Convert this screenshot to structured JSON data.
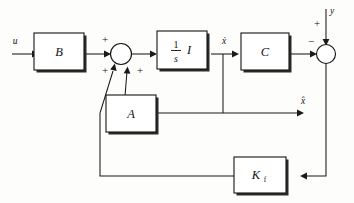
{
  "diagram": {
    "type": "control-block-diagram",
    "background_color": "#fdfdfb",
    "line_color": "#1a1a1a",
    "signals": {
      "input": "u",
      "output": "y",
      "state_derivative": "ẋ",
      "state_estimate": "x̂"
    },
    "blocks": [
      {
        "id": "B",
        "label": "B"
      },
      {
        "id": "integrator",
        "label_numerator": "1",
        "label_denominator": "s",
        "label_matrix": "I"
      },
      {
        "id": "C",
        "label": "C"
      },
      {
        "id": "A",
        "label": "A"
      },
      {
        "id": "Kf",
        "label": "K",
        "subscript": "f"
      }
    ],
    "summing_junctions": [
      {
        "id": "left-sum",
        "signs": {
          "top_left": "+",
          "bottom_left": "+",
          "bottom_right": "+"
        }
      },
      {
        "id": "right-sum",
        "signs": {
          "left": "−",
          "top": "+"
        }
      }
    ],
    "labels": {
      "u": "u",
      "y": "y",
      "xdot_after_integrator": "ẋ",
      "xhat_right": "x̂",
      "B": "B",
      "C": "C",
      "A": "A",
      "K": "K",
      "f": "f",
      "one": "1",
      "s": "s",
      "I": "I",
      "plus": "+",
      "minus": "−"
    }
  }
}
